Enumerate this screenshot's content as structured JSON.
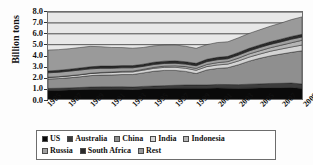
{
  "chart_data": {
    "type": "area",
    "title": "",
    "subtitle": "",
    "xlabel": "",
    "ylabel": "Billion tons",
    "ylim": [
      0.0,
      8.0
    ],
    "ytick_labels": [
      "8.0",
      "7.0",
      "6.0",
      "5.0",
      "4.0",
      "3.0",
      "2.0",
      "1.0",
      "0.0"
    ],
    "ytick_values": [
      8.0,
      7.0,
      6.0,
      5.0,
      4.0,
      3.0,
      2.0,
      1.0,
      0.0
    ],
    "xlim": [
      1985,
      2009
    ],
    "x": [
      1985,
      1986,
      1987,
      1988,
      1989,
      1990,
      1991,
      1992,
      1993,
      1994,
      1995,
      1996,
      1997,
      1998,
      1999,
      2000,
      2001,
      2002,
      2003,
      2004,
      2005,
      2006,
      2007,
      2008,
      2009
    ],
    "xtick_labels": [
      "1985",
      "1987",
      "1989",
      "1991",
      "1993",
      "1995",
      "1997",
      "1999",
      "2001",
      "2003",
      "2005",
      "2007",
      "2009"
    ],
    "xtick_values": [
      1985,
      1987,
      1989,
      1991,
      1993,
      1995,
      1997,
      1999,
      2001,
      2003,
      2005,
      2007,
      2009
    ],
    "stacked": true,
    "grid": true,
    "grid_axis": "y",
    "legend_position": "bottom",
    "series": [
      {
        "name": "US",
        "color": "#0a0a0a",
        "values": [
          0.8,
          0.81,
          0.83,
          0.86,
          0.89,
          0.9,
          0.89,
          0.89,
          0.86,
          0.91,
          0.93,
          0.96,
          0.98,
          1.0,
          0.99,
          0.98,
          1.01,
          0.99,
          0.97,
          1.0,
          1.01,
          1.04,
          1.04,
          1.06,
          0.97
        ]
      },
      {
        "name": "Australia",
        "color": "#3c3c3c",
        "values": [
          0.17,
          0.18,
          0.19,
          0.2,
          0.21,
          0.22,
          0.23,
          0.24,
          0.24,
          0.25,
          0.26,
          0.27,
          0.28,
          0.29,
          0.3,
          0.31,
          0.33,
          0.34,
          0.35,
          0.36,
          0.38,
          0.39,
          0.4,
          0.41,
          0.41
        ]
      },
      {
        "name": "China",
        "color": "#8f8f8f",
        "values": [
          0.87,
          0.89,
          0.93,
          0.98,
          1.05,
          1.08,
          1.09,
          1.12,
          1.15,
          1.24,
          1.36,
          1.4,
          1.37,
          1.25,
          1.05,
          1.38,
          1.47,
          1.55,
          1.83,
          2.12,
          2.35,
          2.53,
          2.69,
          2.82,
          3.05
        ]
      },
      {
        "name": "India",
        "color": "#d4d4d4",
        "values": [
          0.15,
          0.16,
          0.17,
          0.18,
          0.19,
          0.2,
          0.22,
          0.23,
          0.24,
          0.25,
          0.27,
          0.28,
          0.29,
          0.29,
          0.3,
          0.31,
          0.32,
          0.33,
          0.35,
          0.37,
          0.39,
          0.43,
          0.46,
          0.49,
          0.53
        ]
      },
      {
        "name": "Indonesia",
        "color": "#b5b5b5",
        "values": [
          0.01,
          0.01,
          0.02,
          0.02,
          0.03,
          0.04,
          0.05,
          0.06,
          0.07,
          0.08,
          0.09,
          0.11,
          0.13,
          0.15,
          0.17,
          0.19,
          0.21,
          0.23,
          0.26,
          0.29,
          0.3,
          0.32,
          0.35,
          0.39,
          0.44
        ]
      },
      {
        "name": "Russia",
        "color": "#a0a0a0",
        "values": [
          0.41,
          0.41,
          0.42,
          0.42,
          0.4,
          0.39,
          0.35,
          0.33,
          0.31,
          0.27,
          0.26,
          0.25,
          0.24,
          0.23,
          0.25,
          0.26,
          0.27,
          0.26,
          0.28,
          0.28,
          0.3,
          0.31,
          0.31,
          0.33,
          0.3
        ]
      },
      {
        "name": "South Africa",
        "color": "#2b2b2b",
        "values": [
          0.17,
          0.18,
          0.18,
          0.19,
          0.19,
          0.2,
          0.2,
          0.2,
          0.2,
          0.2,
          0.21,
          0.21,
          0.22,
          0.22,
          0.22,
          0.22,
          0.22,
          0.22,
          0.24,
          0.24,
          0.24,
          0.24,
          0.25,
          0.25,
          0.25
        ]
      },
      {
        "name": "Rest",
        "color": "#9a9a9a",
        "values": [
          1.92,
          1.9,
          1.88,
          1.88,
          1.88,
          1.78,
          1.71,
          1.66,
          1.6,
          1.54,
          1.51,
          1.48,
          1.46,
          1.42,
          1.38,
          1.35,
          1.36,
          1.34,
          1.35,
          1.37,
          1.39,
          1.43,
          1.48,
          1.55,
          1.6
        ]
      }
    ],
    "totals": [
      4.5,
      4.54,
      4.62,
      4.73,
      4.84,
      4.81,
      4.74,
      4.73,
      4.67,
      4.74,
      4.89,
      4.96,
      4.97,
      4.85,
      4.66,
      5.0,
      5.19,
      5.26,
      5.63,
      6.03,
      6.36,
      6.69,
      6.98,
      7.3,
      7.55
    ],
    "annotations": []
  },
  "legend": {
    "row1": [
      {
        "label": "US",
        "color": "#0a0a0a"
      },
      {
        "label": "Australia",
        "color": "#3c3c3c"
      },
      {
        "label": "China",
        "color": "#8f8f8f"
      },
      {
        "label": "India",
        "color": "#d4d4d4"
      },
      {
        "label": "Indonesia",
        "color": "#b5b5b5"
      }
    ],
    "row2": [
      {
        "label": "Russia",
        "color": "#a0a0a0"
      },
      {
        "label": "South Africa",
        "color": "#2b2b2b"
      },
      {
        "label": "Rest",
        "color": "#9a9a9a"
      }
    ]
  },
  "colors": {
    "plot_background": "#e8e8e8",
    "frame": "#6d6d6d",
    "gridline": "#555555",
    "text": "#111111"
  }
}
